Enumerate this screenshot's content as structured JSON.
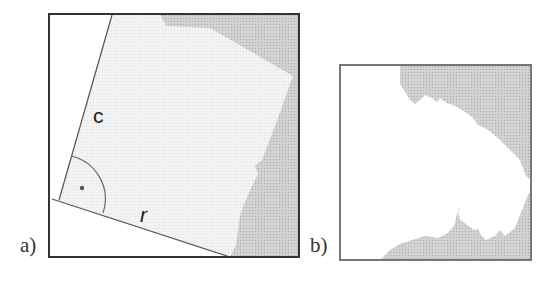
{
  "panels": [
    {
      "label": "a)",
      "edge_labels": {
        "c": "c",
        "r": "r"
      },
      "angle_marker": "right-angle-dot"
    },
    {
      "label": "b)"
    }
  ],
  "colors": {
    "frame": "#333333",
    "frame_b": "#777777",
    "light_fill": "#f1f1f1",
    "dark_fill": "#cfcfcf",
    "background": "#ffffff"
  }
}
